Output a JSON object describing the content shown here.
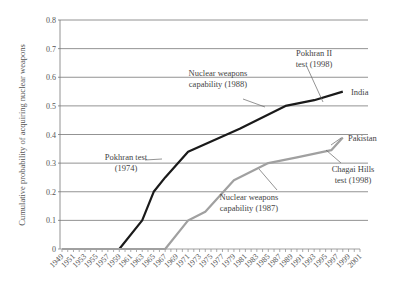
{
  "chart_data": {
    "type": "line",
    "title": "",
    "xlabel": "",
    "ylabel": "Cumulative probability of acquiring nuclear weapons",
    "ylim": [
      0,
      0.8
    ],
    "xlim": [
      1949,
      2001
    ],
    "grid": true,
    "y_ticks": [
      "0",
      "0.1",
      "0.2",
      "0.3",
      "0.4",
      "0.5",
      "0.6",
      "0.7",
      "0.8"
    ],
    "y_tick_values": [
      0,
      0.1,
      0.2,
      0.3,
      0.4,
      0.5,
      0.6,
      0.7,
      0.8
    ],
    "x_ticks": [
      "1949",
      "1951",
      "1953",
      "1955",
      "1957",
      "1959",
      "1961",
      "1963",
      "1965",
      "1967",
      "1969",
      "1971",
      "1973",
      "1975",
      "1977",
      "1979",
      "1981",
      "1983",
      "1985",
      "1987",
      "1989",
      "1991",
      "1993",
      "1995",
      "1997",
      "1999",
      "2001"
    ],
    "series": [
      {
        "name": "India",
        "color": "#1a1a1a",
        "points": [
          [
            1949,
            0
          ],
          [
            1959,
            0
          ],
          [
            1963,
            0.1
          ],
          [
            1965,
            0.2
          ],
          [
            1967,
            0.25
          ],
          [
            1971,
            0.34
          ],
          [
            1980,
            0.42
          ],
          [
            1988,
            0.5
          ],
          [
            1993,
            0.52
          ],
          [
            1998,
            0.55
          ]
        ]
      },
      {
        "name": "Pakistan",
        "color": "#a0a0a0",
        "points": [
          [
            1949,
            0
          ],
          [
            1967,
            0
          ],
          [
            1971,
            0.1
          ],
          [
            1974,
            0.13
          ],
          [
            1979,
            0.24
          ],
          [
            1985,
            0.3
          ],
          [
            1990,
            0.32
          ],
          [
            1996,
            0.345
          ],
          [
            1998,
            0.39
          ]
        ]
      }
    ],
    "annotations": [
      {
        "text": [
          "Pokhran test",
          "(1974)"
        ],
        "series": "India",
        "year": 1974
      },
      {
        "text": [
          "Nuclear weapons",
          "capability (1988)"
        ],
        "series": "India",
        "year": 1988
      },
      {
        "text": [
          "Pokhran II",
          "test (1998)"
        ],
        "series": "India",
        "year": 1998
      },
      {
        "text": [
          "Nuclear weapons",
          "capability (1987)"
        ],
        "series": "Pakistan",
        "year": 1987
      },
      {
        "text": [
          "Chagai Hills",
          "test (1998)"
        ],
        "series": "Pakistan",
        "year": 1998
      }
    ],
    "legend": {
      "position": "inline-right",
      "entries": [
        "India",
        "Pakistan"
      ]
    }
  }
}
